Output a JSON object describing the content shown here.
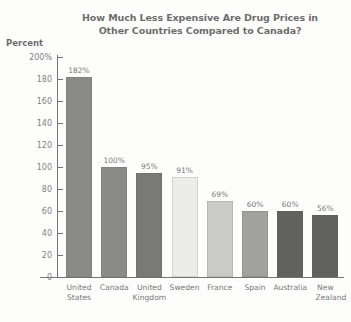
{
  "chart_data": {
    "type": "bar",
    "title": "How Much Less Expensive Are Drug Prices in Other Countries Compared to Canada?",
    "title_lines": [
      "How Much Less Expensive Are Drug Prices in",
      "Other Countries Compared to Canada?"
    ],
    "xlabel": "",
    "ylabel": "Percent",
    "ylim": [
      0,
      200
    ],
    "ytick_labels": [
      "200%",
      "180",
      "160",
      "140",
      "120",
      "100",
      "80",
      "60",
      "40",
      "20",
      "0"
    ],
    "ytick_values": [
      200,
      180,
      160,
      140,
      120,
      100,
      80,
      60,
      40,
      20,
      0
    ],
    "grid": false,
    "legend": false,
    "categories": [
      "United States",
      "Canada",
      "United Kingdom",
      "Sweden",
      "France",
      "Spain",
      "Australia",
      "New Zealand"
    ],
    "category_label_lines": [
      [
        "United",
        "States"
      ],
      [
        "Canada"
      ],
      [
        "United",
        "Kingdom"
      ],
      [
        "Sweden"
      ],
      [
        "France"
      ],
      [
        "Spain"
      ],
      [
        "Australia"
      ],
      [
        "New",
        "Zealand"
      ]
    ],
    "values": [
      182,
      100,
      95,
      91,
      69,
      60,
      60,
      56
    ],
    "value_labels": [
      "182%",
      "100%",
      "95%",
      "91%",
      "69%",
      "60%",
      "60%",
      "56%"
    ],
    "bar_colors": [
      "#4d4d4d",
      "#4d4d4d",
      "#333333",
      "#e4e4e4",
      "#b0b0b0",
      "#707070",
      "#0f0f0f",
      "#0f0f0f"
    ]
  },
  "axis": {
    "percent_label": "Percent"
  }
}
